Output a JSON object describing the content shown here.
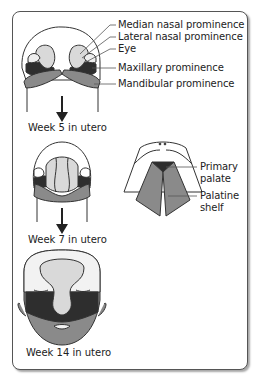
{
  "figure": {
    "stages": [
      {
        "caption": "Week 5 in utero"
      },
      {
        "caption": "Week 7 in utero"
      },
      {
        "caption": "Week 14 in utero"
      }
    ],
    "week5_labels": [
      "Median nasal prominence",
      "Lateral nasal prominence",
      "Eye",
      "Maxillary prominence",
      "Mandibular prominence"
    ],
    "palate_labels": {
      "primary_palate": [
        "Primary",
        "palate"
      ],
      "palatine_shelf": [
        "Palatine",
        "shelf"
      ]
    },
    "colors": {
      "frame": "#555555",
      "light_gray": "#d9d9d9",
      "mid_gray": "#8a8a8a",
      "dark": "#2e2e2e",
      "skin": "#f2f2f2"
    }
  }
}
